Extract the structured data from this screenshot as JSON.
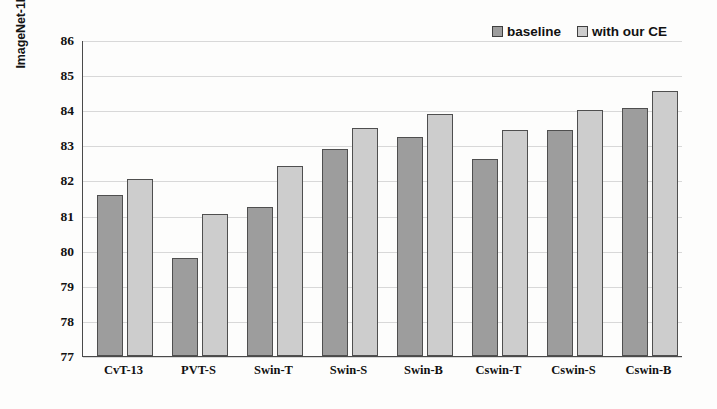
{
  "chart_data": {
    "type": "bar",
    "title": "",
    "xlabel": "",
    "ylabel": "ImageNet-1K Top-1 accuracy(%)",
    "ylim": [
      77,
      86
    ],
    "ytick_step": 1,
    "yticks": [
      86,
      85,
      84,
      83,
      82,
      81,
      80,
      79,
      78,
      77
    ],
    "grid": true,
    "legend_position": "top-right",
    "categories": [
      "CvT-13",
      "PVT-S",
      "Swin-T",
      "Swin-S",
      "Swin-B",
      "Cswin-T",
      "Cswin-S",
      "Cswin-B"
    ],
    "series": [
      {
        "name": "baseline",
        "color": "#9d9d9d",
        "values": [
          81.6,
          79.8,
          81.25,
          82.9,
          83.25,
          82.6,
          83.45,
          84.05
        ]
      },
      {
        "name": "with our CE",
        "color": "#cdcdcd",
        "values": [
          82.05,
          81.05,
          82.4,
          83.5,
          83.9,
          83.45,
          84.0,
          84.55
        ]
      }
    ]
  },
  "legend": {
    "items": [
      {
        "label": "baseline",
        "swatch": "baseline-swatch"
      },
      {
        "label": "with our CE",
        "swatch": "with-our-ce-swatch"
      }
    ]
  }
}
